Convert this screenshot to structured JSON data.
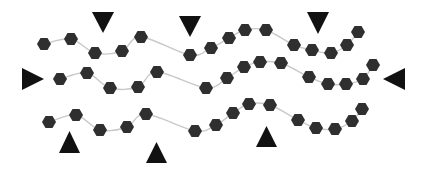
{
  "diagram": {
    "colors": {
      "background": "#ffffff",
      "hexagon": "#2f2f2f",
      "connector": "#c9c9c9",
      "triangle": "#111111"
    },
    "hex_size": {
      "w": 14,
      "h": 12
    },
    "chains": [
      {
        "name": "top-chain",
        "nodes": [
          [
            44,
            44
          ],
          [
            71,
            39
          ],
          [
            95,
            53
          ],
          [
            122,
            51
          ],
          [
            141,
            37
          ],
          [
            190,
            55
          ],
          [
            211,
            48
          ],
          [
            229,
            38
          ],
          [
            245,
            30
          ],
          [
            266,
            30
          ],
          [
            294,
            45
          ],
          [
            312,
            50
          ],
          [
            331,
            53
          ],
          [
            347,
            45
          ],
          [
            358,
            32
          ]
        ]
      },
      {
        "name": "middle-chain",
        "nodes": [
          [
            60,
            79
          ],
          [
            87,
            73
          ],
          [
            110,
            88
          ],
          [
            138,
            87
          ],
          [
            157,
            72
          ],
          [
            206,
            88
          ],
          [
            227,
            78
          ],
          [
            244,
            67
          ],
          [
            260,
            62
          ],
          [
            281,
            63
          ],
          [
            309,
            77
          ],
          [
            328,
            84
          ],
          [
            346,
            84
          ],
          [
            363,
            79
          ],
          [
            373,
            65
          ]
        ]
      },
      {
        "name": "bottom-chain",
        "nodes": [
          [
            49,
            122
          ],
          [
            76,
            115
          ],
          [
            100,
            130
          ],
          [
            127,
            127
          ],
          [
            146,
            114
          ],
          [
            195,
            131
          ],
          [
            216,
            125
          ],
          [
            233,
            113
          ],
          [
            249,
            104
          ],
          [
            270,
            105
          ],
          [
            298,
            120
          ],
          [
            316,
            128
          ],
          [
            335,
            129
          ],
          [
            352,
            121
          ],
          [
            362,
            109
          ]
        ]
      }
    ],
    "triangles": [
      {
        "name": "triangle-top-1",
        "direction": "down",
        "x": 92,
        "y": 12,
        "w": 22,
        "h": 21
      },
      {
        "name": "triangle-top-2",
        "direction": "down",
        "x": 179,
        "y": 16,
        "w": 22,
        "h": 21
      },
      {
        "name": "triangle-top-3",
        "direction": "down",
        "x": 307,
        "y": 12,
        "w": 22,
        "h": 22
      },
      {
        "name": "triangle-left",
        "direction": "right",
        "x": 22,
        "y": 68,
        "w": 22,
        "h": 22
      },
      {
        "name": "triangle-right",
        "direction": "left",
        "x": 383,
        "y": 68,
        "w": 22,
        "h": 22
      },
      {
        "name": "triangle-bottom-1",
        "direction": "up",
        "x": 59,
        "y": 131,
        "w": 21,
        "h": 22
      },
      {
        "name": "triangle-bottom-2",
        "direction": "up",
        "x": 146,
        "y": 142,
        "w": 21,
        "h": 21
      },
      {
        "name": "triangle-bottom-3",
        "direction": "up",
        "x": 256,
        "y": 126,
        "w": 21,
        "h": 21
      }
    ]
  }
}
